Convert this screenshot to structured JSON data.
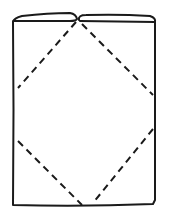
{
  "diagram": {
    "title": "Folded paper with dashed diamond fold lines",
    "stroke_color": "#1a1a1a",
    "background": "#ffffff",
    "elements": [
      {
        "name": "outer-rectangle",
        "type": "solid"
      },
      {
        "name": "top-left-flap",
        "type": "solid"
      },
      {
        "name": "top-right-flap",
        "type": "solid"
      },
      {
        "name": "dashed-fold-lines",
        "type": "dashed"
      }
    ]
  }
}
